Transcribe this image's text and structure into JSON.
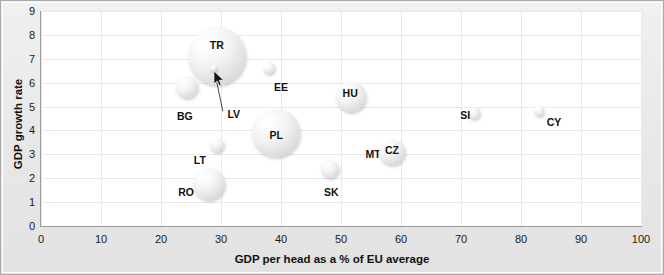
{
  "chart_data": {
    "type": "scatter",
    "title": "",
    "xlabel": "GDP per head as a % of EU average",
    "ylabel": "GDP growth rate",
    "xlim": [
      0,
      100
    ],
    "ylim": [
      0,
      9
    ],
    "xticks": [
      "0",
      "10",
      "20",
      "30",
      "40",
      "50",
      "60",
      "70",
      "80",
      "90",
      "100"
    ],
    "yticks": [
      "0",
      "1",
      "2",
      "3",
      "4",
      "5",
      "6",
      "7",
      "8",
      "9"
    ],
    "grid": true,
    "legend": "none",
    "bubble_note": "bubble area encodes population size",
    "points": [
      {
        "label": "TR",
        "x": 29.3,
        "y": 7.1,
        "r": 29,
        "label_dx": 0,
        "label_dy": -11,
        "label_inside": true
      },
      {
        "label": "BG",
        "x": 24.3,
        "y": 5.8,
        "r": 11,
        "label_dx": -2,
        "label_dy": 29,
        "label_inside": false
      },
      {
        "label": "LV",
        "x": 28.8,
        "y": 6.6,
        "r": 3,
        "label_dx": 20,
        "label_dy": 46,
        "label_inside": false
      },
      {
        "label": "EE",
        "x": 38.0,
        "y": 6.6,
        "r": 6,
        "label_dx": 12,
        "label_dy": 19,
        "label_inside": false
      },
      {
        "label": "HU",
        "x": 51.7,
        "y": 5.4,
        "r": 15,
        "label_dx": -1,
        "label_dy": -4,
        "label_inside": true
      },
      {
        "label": "MT",
        "x": 52.0,
        "y": 4.2,
        "r": 0,
        "label_dx": 20,
        "label_dy": 28,
        "label_inside": false
      },
      {
        "label": "SI",
        "x": 72.2,
        "y": 4.75,
        "r": 6,
        "label_dx": -9,
        "label_dy": 2,
        "label_inside": false
      },
      {
        "label": "CY",
        "x": 83.0,
        "y": 4.8,
        "r": 5,
        "label_dx": 15,
        "label_dy": 11,
        "label_inside": false
      },
      {
        "label": "PL",
        "x": 39.2,
        "y": 3.9,
        "r": 24,
        "label_dx": 0,
        "label_dy": 2,
        "label_inside": true
      },
      {
        "label": "CZ",
        "x": 58.5,
        "y": 3.1,
        "r": 13,
        "label_dx": 0,
        "label_dy": -2,
        "label_inside": true
      },
      {
        "label": "LT",
        "x": 29.3,
        "y": 3.4,
        "r": 7,
        "label_dx": -17,
        "label_dy": 15,
        "label_inside": false
      },
      {
        "label": "SK",
        "x": 48.2,
        "y": 2.4,
        "r": 9,
        "label_dx": 1,
        "label_dy": 23,
        "label_inside": false
      },
      {
        "label": "RO",
        "x": 28.0,
        "y": 1.75,
        "r": 16,
        "label_dx": -23,
        "label_dy": 8,
        "label_inside": false
      }
    ],
    "cursor": {
      "x": 29.0,
      "y": 6.4,
      "icon": "mouse-pointer-icon"
    },
    "leader_line": {
      "from_x": 29.0,
      "from_y": 6.4,
      "to_x": 30.3,
      "to_y": 4.8
    },
    "colors": {
      "plot_background": "#ffffff",
      "frame_background": "#eaeaea",
      "gridline": "#e8e8ef",
      "axis": "#9a9a9a",
      "bubble_fill": "#e4e4e4",
      "text": "#111111"
    }
  }
}
